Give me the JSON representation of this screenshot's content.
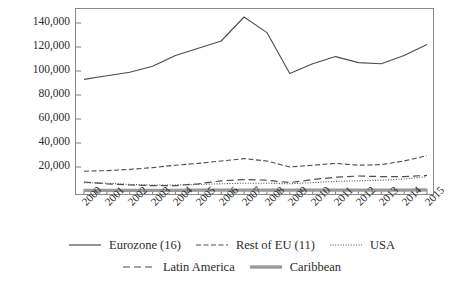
{
  "chart_data": {
    "type": "line",
    "title": "",
    "subtitle": "",
    "xlabel": "",
    "ylabel": "Thousands of Euros",
    "x": [
      "2000",
      "2001",
      "2002",
      "2003",
      "2004",
      "2005",
      "2006",
      "2007",
      "2008",
      "2009",
      "2010",
      "2011",
      "2012",
      "2013",
      "2014",
      "2015"
    ],
    "xlim": [
      2000,
      2015
    ],
    "ylim": [
      0,
      150000
    ],
    "ytick_values": [
      20000,
      40000,
      60000,
      80000,
      100000,
      120000,
      140000
    ],
    "ytick_labels": [
      "20,000",
      "40,000",
      "60,000",
      "80,000",
      "100,000",
      "120,000",
      "140,000"
    ],
    "grid": false,
    "legend_position": "bottom",
    "series": [
      {
        "name": "Eurozone (16)",
        "style": "solid",
        "color": "#4d4d4d",
        "width": 1.1,
        "values": [
          93000,
          96000,
          99000,
          104000,
          113000,
          119000,
          125000,
          145000,
          132000,
          98000,
          106000,
          112000,
          107000,
          106000,
          113000,
          122000
        ]
      },
      {
        "name": "Rest of EU (11)",
        "style": "dashed",
        "color": "#4d4d4d",
        "width": 1.1,
        "values": [
          16500,
          17000,
          18000,
          19500,
          21500,
          23000,
          25000,
          27000,
          25000,
          20000,
          21500,
          23000,
          21500,
          22000,
          25000,
          29500
        ]
      },
      {
        "name": "USA",
        "style": "dotted",
        "color": "#4d4d4d",
        "width": 1.1,
        "values": [
          7000,
          6500,
          5500,
          5000,
          5000,
          5500,
          6000,
          6500,
          6500,
          6000,
          7000,
          8000,
          8500,
          9000,
          10000,
          12000
        ]
      },
      {
        "name": "Latin America",
        "style": "longdash",
        "color": "#4d4d4d",
        "width": 1.2,
        "values": [
          7500,
          6000,
          5000,
          4500,
          4500,
          6000,
          8500,
          9500,
          9000,
          7000,
          9500,
          11500,
          12500,
          12000,
          12000,
          13000
        ]
      },
      {
        "name": "Caribbean",
        "style": "thick-solid",
        "color": "#9a9a9a",
        "width": 3.2,
        "values": [
          600,
          600,
          600,
          600,
          600,
          700,
          700,
          800,
          800,
          700,
          700,
          800,
          800,
          800,
          800,
          900
        ]
      }
    ]
  },
  "legend": {
    "rows": [
      [
        "Eurozone (16)",
        "Rest of EU (11)",
        "USA"
      ],
      [
        "Latin America",
        "Caribbean"
      ]
    ]
  }
}
